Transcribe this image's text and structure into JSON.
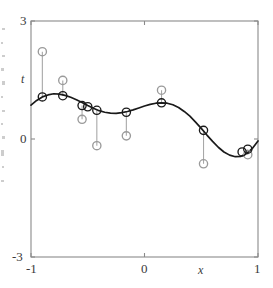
{
  "chart_data": {
    "type": "scatter",
    "title": "",
    "subtitle": "",
    "xlabel": "x",
    "ylabel": "t",
    "xlim": [
      -1,
      1
    ],
    "ylim": [
      -3,
      3
    ],
    "xticks": [
      -1,
      0,
      1
    ],
    "xtick_labels": [
      "-1",
      "0",
      "1"
    ],
    "yticks": [
      -3,
      0,
      3
    ],
    "ytick_labels": [
      "-3",
      "0",
      "3"
    ],
    "grid": false,
    "legend": "none",
    "series": [
      {
        "name": "model fit curve",
        "kind": "line",
        "color": "#1a1a1a",
        "x": [
          -1.0,
          -0.95,
          -0.9,
          -0.85,
          -0.8,
          -0.75,
          -0.7,
          -0.65,
          -0.6,
          -0.55,
          -0.5,
          -0.45,
          -0.4,
          -0.35,
          -0.3,
          -0.25,
          -0.2,
          -0.15,
          -0.1,
          -0.05,
          0.0,
          0.05,
          0.1,
          0.15,
          0.2,
          0.25,
          0.3,
          0.35,
          0.4,
          0.45,
          0.5,
          0.55,
          0.6,
          0.65,
          0.7,
          0.75,
          0.8,
          0.85,
          0.9,
          0.95,
          1.0
        ],
        "y": [
          0.86,
          0.98,
          1.07,
          1.12,
          1.15,
          1.14,
          1.11,
          1.06,
          1.0,
          0.93,
          0.85,
          0.78,
          0.72,
          0.68,
          0.66,
          0.65,
          0.67,
          0.7,
          0.74,
          0.79,
          0.84,
          0.88,
          0.91,
          0.92,
          0.91,
          0.87,
          0.8,
          0.7,
          0.58,
          0.43,
          0.27,
          0.1,
          -0.06,
          -0.21,
          -0.33,
          -0.41,
          -0.45,
          -0.44,
          -0.37,
          -0.24,
          -0.05
        ]
      },
      {
        "name": "curve anchor points",
        "kind": "marker-on-curve",
        "color": "#1a1a1a",
        "x": [
          -0.9,
          -0.72,
          -0.55,
          -0.5,
          -0.42,
          -0.16,
          0.15,
          0.52,
          0.86,
          0.91
        ],
        "y": [
          1.07,
          1.1,
          0.85,
          0.82,
          0.73,
          0.68,
          0.92,
          0.22,
          -0.33,
          -0.26
        ]
      },
      {
        "name": "observed target values",
        "kind": "marker-observed",
        "color": "#9a9a9a",
        "x": [
          -0.9,
          -0.72,
          -0.55,
          -0.42,
          -0.16,
          0.15,
          0.52,
          0.91
        ],
        "y": [
          2.22,
          1.49,
          0.5,
          -0.17,
          0.08,
          1.24,
          -0.63,
          -0.4
        ]
      }
    ],
    "residual_segments": [
      {
        "x": -0.9,
        "y_curve": 1.07,
        "y_obs": 2.22
      },
      {
        "x": -0.72,
        "y_curve": 1.1,
        "y_obs": 1.49
      },
      {
        "x": -0.55,
        "y_curve": 0.85,
        "y_obs": 0.5
      },
      {
        "x": -0.42,
        "y_curve": 0.73,
        "y_obs": -0.17
      },
      {
        "x": -0.16,
        "y_curve": 0.68,
        "y_obs": 0.08
      },
      {
        "x": 0.15,
        "y_curve": 0.92,
        "y_obs": 1.24
      },
      {
        "x": 0.52,
        "y_curve": 0.22,
        "y_obs": -0.63
      },
      {
        "x": 0.91,
        "y_curve": -0.26,
        "y_obs": -0.4
      }
    ],
    "annotations": [],
    "colors": {
      "curve": "#1a1a1a",
      "frame": "#808080",
      "observed_marker": "#9a9a9a",
      "residual_line": "#a8a8a8",
      "text": "#3a3a3a",
      "background": "#ffffff"
    }
  },
  "figure": {
    "plot_frame": {
      "left": 31,
      "top": 21,
      "right": 258,
      "bottom": 257
    },
    "axis_labels": {
      "y": "t",
      "x": "x"
    },
    "y_tick_labels": {
      "top": "3",
      "middle": "0",
      "bottom": "-3"
    },
    "x_tick_labels": {
      "left": "-1",
      "middle": "0",
      "right": "1"
    }
  }
}
